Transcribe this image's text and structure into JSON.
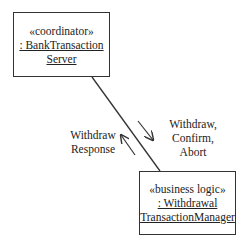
{
  "diagram": {
    "type": "communication",
    "objects": [
      {
        "id": "bank-transaction-server",
        "stereotype": "«coordinator»",
        "name_line1": ": BankTransaction",
        "name_line2": "Server"
      },
      {
        "id": "withdrawal-transaction-manager",
        "stereotype": "«business logic»",
        "name_line1": ": Withdrawal",
        "name_line2": "TransactionManager"
      }
    ],
    "links": [
      {
        "from": "bank-transaction-server",
        "to": "withdrawal-transaction-manager"
      }
    ],
    "messages": {
      "to_manager": {
        "line1": "Withdraw,",
        "line2": "Confirm,",
        "line3": "Abort"
      },
      "to_server": {
        "line1": "Withdraw",
        "line2": "Response"
      }
    },
    "colors": {
      "line": "#333333",
      "background": "#ffffff"
    }
  }
}
